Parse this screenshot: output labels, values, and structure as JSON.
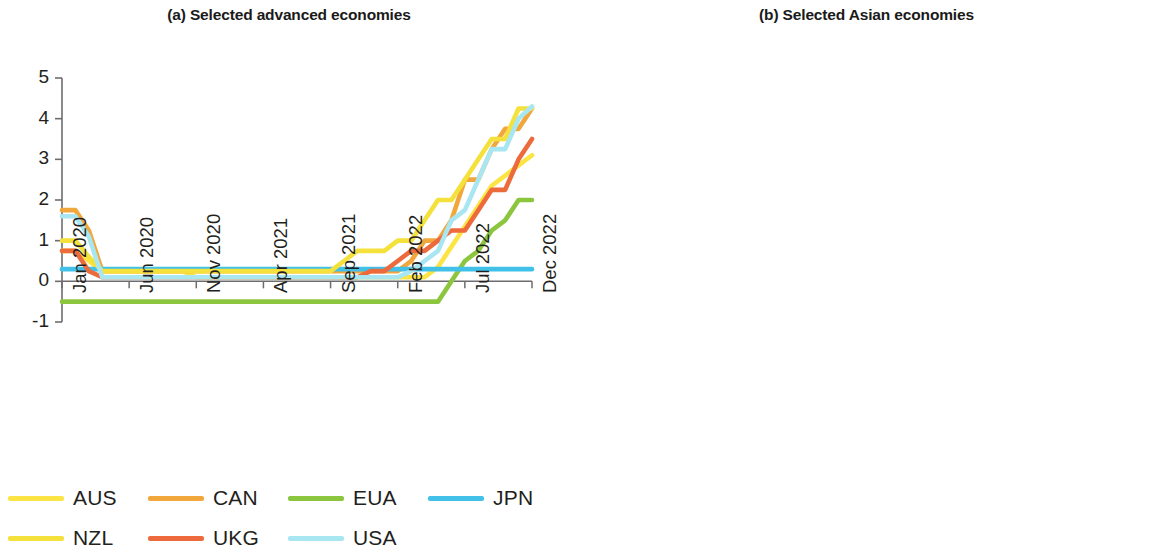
{
  "figure": {
    "background": "#ffffff",
    "axis_color": "#6d6d6d",
    "text_color": "#231f20"
  },
  "panels": [
    {
      "id": "a",
      "title": "(a) Selected advanced economies"
    },
    {
      "id": "b",
      "title": "(b) Selected Asian economies"
    }
  ],
  "chart_data": [
    {
      "type": "line",
      "title": "(a) Selected advanced economies",
      "xlabel": "",
      "ylabel": "",
      "ylim": [
        -1,
        5
      ],
      "yticks": [
        -1,
        0,
        1,
        2,
        3,
        4,
        5
      ],
      "ytick_labels": [
        "-1",
        "0",
        "1",
        "2",
        "3",
        "4",
        "5"
      ],
      "grid": false,
      "zero_line": true,
      "legend_position": "bottom",
      "x": [
        "Jan 2020",
        "Feb 2020",
        "Mar 2020",
        "Apr 2020",
        "May 2020",
        "Jun 2020",
        "Jul 2020",
        "Aug 2020",
        "Sep 2020",
        "Oct 2020",
        "Nov 2020",
        "Dec 2020",
        "Jan 2021",
        "Feb 2021",
        "Mar 2021",
        "Apr 2021",
        "May 2021",
        "Jun 2021",
        "Jul 2021",
        "Aug 2021",
        "Sep 2021",
        "Oct 2021",
        "Nov 2021",
        "Dec 2021",
        "Jan 2022",
        "Feb 2022",
        "Mar 2022",
        "Apr 2022",
        "May 2022",
        "Jun 2022",
        "Jul 2022",
        "Aug 2022",
        "Sep 2022",
        "Oct 2022",
        "Nov 2022",
        "Dec 2022"
      ],
      "xticks": [
        "Jan 2020",
        "Jun 2020",
        "Nov 2020",
        "Apr 2021",
        "Sep 2021",
        "Feb 2022",
        "Jul 2022",
        "Dec 2022"
      ],
      "xtick_indices": [
        0,
        5,
        10,
        15,
        20,
        25,
        30,
        35
      ],
      "series": [
        {
          "name": "AUS",
          "color": "#fde445",
          "values": [
            0.75,
            0.75,
            0.5,
            0.25,
            0.25,
            0.25,
            0.25,
            0.25,
            0.25,
            0.25,
            0.1,
            0.1,
            0.1,
            0.1,
            0.1,
            0.1,
            0.1,
            0.1,
            0.1,
            0.1,
            0.1,
            0.1,
            0.1,
            0.1,
            0.1,
            0.1,
            0.1,
            0.1,
            0.35,
            0.85,
            1.35,
            1.85,
            2.35,
            2.6,
            2.85,
            3.1
          ]
        },
        {
          "name": "CAN",
          "color": "#f2a73d",
          "values": [
            1.75,
            1.75,
            1.25,
            0.25,
            0.25,
            0.25,
            0.25,
            0.25,
            0.25,
            0.25,
            0.25,
            0.25,
            0.25,
            0.25,
            0.25,
            0.25,
            0.25,
            0.25,
            0.25,
            0.25,
            0.25,
            0.25,
            0.25,
            0.25,
            0.25,
            0.25,
            0.5,
            1.0,
            1.0,
            1.5,
            2.5,
            2.5,
            3.25,
            3.75,
            3.75,
            4.25
          ]
        },
        {
          "name": "EUA",
          "color": "#8cc63e",
          "values": [
            -0.5,
            -0.5,
            -0.5,
            -0.5,
            -0.5,
            -0.5,
            -0.5,
            -0.5,
            -0.5,
            -0.5,
            -0.5,
            -0.5,
            -0.5,
            -0.5,
            -0.5,
            -0.5,
            -0.5,
            -0.5,
            -0.5,
            -0.5,
            -0.5,
            -0.5,
            -0.5,
            -0.5,
            -0.5,
            -0.5,
            -0.5,
            -0.5,
            -0.5,
            0.0,
            0.5,
            0.75,
            1.25,
            1.5,
            2.0,
            2.0
          ]
        },
        {
          "name": "JPN",
          "color": "#41c0e8",
          "values": [
            0.3,
            0.3,
            0.3,
            0.3,
            0.3,
            0.3,
            0.3,
            0.3,
            0.3,
            0.3,
            0.3,
            0.3,
            0.3,
            0.3,
            0.3,
            0.3,
            0.3,
            0.3,
            0.3,
            0.3,
            0.3,
            0.3,
            0.3,
            0.3,
            0.3,
            0.3,
            0.3,
            0.3,
            0.3,
            0.3,
            0.3,
            0.3,
            0.3,
            0.3,
            0.3,
            0.3
          ]
        },
        {
          "name": "NZL",
          "color": "#f5e13c",
          "values": [
            1.0,
            1.0,
            0.6,
            0.25,
            0.25,
            0.25,
            0.25,
            0.25,
            0.25,
            0.25,
            0.25,
            0.25,
            0.25,
            0.25,
            0.25,
            0.25,
            0.25,
            0.25,
            0.25,
            0.25,
            0.25,
            0.5,
            0.75,
            0.75,
            0.75,
            1.0,
            1.0,
            1.5,
            2.0,
            2.0,
            2.5,
            3.0,
            3.5,
            3.5,
            4.25,
            4.25
          ]
        },
        {
          "name": "UKG",
          "color": "#ec6a3c",
          "values": [
            0.75,
            0.75,
            0.25,
            0.1,
            0.1,
            0.1,
            0.1,
            0.1,
            0.1,
            0.1,
            0.1,
            0.1,
            0.1,
            0.1,
            0.1,
            0.1,
            0.1,
            0.1,
            0.1,
            0.1,
            0.1,
            0.1,
            0.1,
            0.25,
            0.25,
            0.5,
            0.75,
            0.75,
            1.0,
            1.25,
            1.25,
            1.75,
            2.25,
            2.25,
            3.0,
            3.5
          ]
        },
        {
          "name": "USA",
          "color": "#a8e6f2",
          "values": [
            1.6,
            1.6,
            1.1,
            0.1,
            0.1,
            0.1,
            0.1,
            0.1,
            0.1,
            0.1,
            0.1,
            0.1,
            0.1,
            0.1,
            0.1,
            0.1,
            0.1,
            0.1,
            0.1,
            0.1,
            0.1,
            0.1,
            0.1,
            0.1,
            0.1,
            0.1,
            0.25,
            0.5,
            0.75,
            1.5,
            1.75,
            2.5,
            3.25,
            3.25,
            4.0,
            4.3
          ]
        }
      ]
    },
    {
      "type": "line",
      "title": "(b) Selected Asian economies",
      "xlabel": "",
      "ylabel": "",
      "ylim": [
        0,
        16
      ],
      "yticks": [
        0,
        4,
        8,
        12,
        16
      ],
      "ytick_labels": [
        "0",
        "4",
        "8",
        "12",
        "16"
      ],
      "grid": false,
      "zero_line": false,
      "legend_position": "bottom",
      "x": [
        "Jan 2020",
        "Feb 2020",
        "Mar 2020",
        "Apr 2020",
        "May 2020",
        "Jun 2020",
        "Jul 2020",
        "Aug 2020",
        "Sep 2020",
        "Oct 2020",
        "Nov 2020",
        "Dec 2020",
        "Jan 2021",
        "Feb 2021",
        "Mar 2021",
        "Apr 2021",
        "May 2021",
        "Jun 2021",
        "Jul 2021",
        "Aug 2021",
        "Sep 2021",
        "Oct 2021",
        "Nov 2021",
        "Dec 2021",
        "Jan 2022",
        "Feb 2022",
        "Mar 2022",
        "Apr 2022",
        "May 2022",
        "Jun 2022",
        "Jul 2022",
        "Aug 2022",
        "Sep 2022",
        "Oct 2022",
        "Nov 2022",
        "Dec 2022"
      ],
      "xticks": [
        "Jan 2020",
        "Jun 2020",
        "Nov 2020",
        "Apr 2021",
        "Sep 2021",
        "Feb 2022",
        "Jul 2022",
        "Dec 2022"
      ],
      "xtick_indices": [
        0,
        5,
        10,
        15,
        20,
        25,
        30,
        35
      ],
      "series": [
        {
          "name": "ARM",
          "color": "#f2a73d",
          "values": [
            5.5,
            5.5,
            5.25,
            5.0,
            5.0,
            4.5,
            4.5,
            4.5,
            4.5,
            4.5,
            4.5,
            4.5,
            4.5,
            4.5,
            4.5,
            4.5,
            4.75,
            5.0,
            5.5,
            5.5,
            6.0,
            6.5,
            6.5,
            7.0,
            7.25,
            7.75,
            8.0,
            8.0,
            8.25,
            8.5,
            8.75,
            9.0,
            9.5,
            9.75,
            10.25,
            10.7
          ]
        },
        {
          "name": "HKG",
          "color": "#f5a08a",
          "values": [
            2.0,
            1.8,
            1.5,
            1.0,
            0.6,
            0.5,
            0.5,
            0.5,
            0.5,
            0.5,
            0.5,
            0.5,
            0.5,
            0.5,
            0.5,
            0.5,
            0.5,
            0.5,
            0.5,
            0.5,
            0.5,
            0.5,
            0.5,
            0.5,
            0.5,
            0.6,
            0.8,
            1.3,
            1.8,
            2.2,
            2.6,
            3.0,
            3.4,
            3.8,
            4.2,
            4.5
          ]
        },
        {
          "name": "IND",
          "color": "#8ad9f0",
          "values": [
            5.15,
            5.15,
            4.4,
            4.4,
            4.4,
            4.0,
            4.0,
            4.0,
            4.0,
            4.0,
            4.0,
            4.0,
            4.0,
            4.0,
            4.0,
            4.0,
            4.0,
            4.0,
            4.0,
            4.0,
            4.0,
            4.0,
            4.0,
            4.0,
            4.0,
            4.0,
            4.0,
            4.4,
            4.9,
            4.9,
            5.4,
            5.4,
            5.9,
            5.9,
            6.25,
            6.25
          ]
        },
        {
          "name": "KAZ",
          "color": "#8cc63e",
          "values": [
            9.25,
            9.25,
            9.5,
            12.0,
            9.5,
            9.5,
            9.5,
            9.5,
            9.0,
            9.0,
            9.0,
            9.0,
            9.0,
            9.0,
            9.0,
            9.0,
            9.0,
            9.25,
            9.25,
            9.25,
            9.5,
            9.75,
            9.75,
            9.75,
            10.25,
            13.5,
            14.0,
            14.0,
            14.0,
            14.0,
            14.5,
            14.5,
            14.5,
            16.0,
            16.0,
            16.0
          ]
        },
        {
          "name": "KOR",
          "color": "#f8f39a",
          "values": [
            1.25,
            1.25,
            0.75,
            0.75,
            0.5,
            0.5,
            0.5,
            0.5,
            0.5,
            0.5,
            0.5,
            0.5,
            0.5,
            0.5,
            0.5,
            0.5,
            0.5,
            0.5,
            0.5,
            0.75,
            0.75,
            0.75,
            1.0,
            1.0,
            1.0,
            1.25,
            1.25,
            1.5,
            1.75,
            1.75,
            2.25,
            2.5,
            2.5,
            3.0,
            3.25,
            3.25
          ]
        },
        {
          "name": "KGZ",
          "color": "#fce82c",
          "values": [
            4.25,
            4.25,
            4.0,
            3.0,
            2.5,
            2.0,
            2.0,
            1.75,
            1.75,
            1.75,
            1.75,
            1.75,
            1.75,
            1.75,
            1.75,
            1.75,
            2.0,
            4.25,
            4.5,
            4.5,
            5.0,
            5.75,
            5.5,
            5.5,
            6.0,
            6.0,
            12.5,
            14.0,
            14.0,
            14.0,
            14.0,
            14.0,
            14.0,
            14.0,
            13.0,
            13.0
          ]
        },
        {
          "name": "MAL",
          "color": "#42b8dd",
          "values": [
            2.75,
            2.75,
            2.5,
            2.25,
            1.75,
            1.75,
            1.75,
            1.75,
            1.75,
            1.75,
            1.75,
            1.75,
            1.75,
            1.75,
            1.75,
            1.75,
            1.75,
            1.75,
            1.75,
            1.75,
            1.75,
            1.75,
            1.75,
            1.75,
            1.75,
            1.75,
            1.75,
            1.75,
            2.0,
            2.0,
            2.25,
            2.5,
            2.5,
            2.75,
            2.75,
            2.75
          ]
        },
        {
          "name": "NEP",
          "color": "#f2834a",
          "values": [
            6.0,
            6.0,
            5.5,
            5.0,
            5.0,
            5.0,
            5.0,
            5.0,
            5.0,
            5.0,
            5.0,
            5.0,
            5.0,
            5.0,
            5.0,
            5.0,
            5.0,
            5.0,
            5.0,
            5.0,
            5.0,
            5.0,
            5.0,
            5.0,
            5.0,
            5.5,
            7.0,
            7.0,
            7.0,
            7.0,
            7.0,
            8.5,
            8.5,
            8.5,
            8.5,
            8.5
          ]
        },
        {
          "name": "PHI",
          "color": "#e8ea4a",
          "values": [
            4.0,
            4.0,
            3.25,
            2.75,
            2.75,
            2.25,
            2.25,
            2.25,
            2.0,
            2.0,
            2.0,
            2.0,
            2.0,
            2.0,
            2.0,
            2.0,
            2.0,
            2.0,
            2.0,
            2.0,
            2.0,
            2.0,
            2.0,
            2.0,
            2.0,
            2.0,
            2.0,
            2.4,
            2.75,
            3.25,
            3.5,
            4.0,
            4.25,
            4.75,
            5.5,
            5.5
          ]
        },
        {
          "name": "PRC",
          "color": "#f2733f",
          "values": [
            4.0,
            4.0,
            4.0,
            4.0,
            4.0,
            4.0,
            4.0,
            4.0,
            3.85,
            3.85,
            3.85,
            3.85,
            3.85,
            3.85,
            3.85,
            3.85,
            3.85,
            3.85,
            3.85,
            3.85,
            3.85,
            3.85,
            3.85,
            3.85,
            3.7,
            3.7,
            3.7,
            3.7,
            3.7,
            3.7,
            3.7,
            3.65,
            3.65,
            3.65,
            3.65,
            3.65
          ]
        },
        {
          "name": "SRI",
          "color": "#a8d4f0",
          "values": [
            6.5,
            6.5,
            6.25,
            6.0,
            6.0,
            5.5,
            5.25,
            5.0,
            4.75,
            4.5,
            4.5,
            4.5,
            4.5,
            4.5,
            4.5,
            4.5,
            4.5,
            4.5,
            4.5,
            4.5,
            4.5,
            4.5,
            4.5,
            4.5,
            5.5,
            6.5,
            7.5,
            11.5,
            14.5,
            14.5,
            14.5,
            14.5,
            14.5,
            14.5,
            14.5,
            14.5
          ]
        },
        {
          "name": "TAP",
          "color": "#41c0e8",
          "values": [
            1.15,
            1.15,
            1.15,
            1.1,
            1.1,
            1.1,
            1.1,
            1.1,
            1.1,
            1.1,
            1.1,
            1.1,
            1.1,
            1.1,
            1.1,
            1.1,
            1.1,
            1.1,
            1.1,
            1.1,
            1.1,
            1.1,
            1.1,
            1.1,
            1.15,
            1.2,
            1.3,
            1.4,
            1.45,
            1.5,
            1.55,
            1.6,
            1.65,
            1.7,
            1.75,
            1.75
          ]
        }
      ]
    }
  ],
  "legends": {
    "panel_a": [
      {
        "label": "AUS",
        "color": "#fde445"
      },
      {
        "label": "CAN",
        "color": "#f2a73d"
      },
      {
        "label": "EUA",
        "color": "#8cc63e"
      },
      {
        "label": "JPN",
        "color": "#41c0e8"
      },
      {
        "label": "NZL",
        "color": "#f5e13c"
      },
      {
        "label": "UKG",
        "color": "#ec6a3c"
      },
      {
        "label": "USA",
        "color": "#a8e6f2"
      }
    ],
    "panel_b": [
      {
        "label": "ARM",
        "color": "#f2a73d"
      },
      {
        "label": "HKG",
        "color": "#f5a08a"
      },
      {
        "label": "IND",
        "color": "#8ad9f0"
      },
      {
        "label": "KAZ",
        "color": "#8cc63e"
      },
      {
        "label": "KOR",
        "color": "#f8f39a"
      },
      {
        "label": "KGZ",
        "color": "#fce82c"
      },
      {
        "label": "MAL",
        "color": "#42b8dd"
      },
      {
        "label": "NEP",
        "color": "#f2834a"
      },
      {
        "label": "PHI",
        "color": "#e8ea4a"
      },
      {
        "label": "PRC",
        "color": "#f2733f"
      },
      {
        "label": "SRI",
        "color": "#a8d4f0"
      },
      {
        "label": "TAP",
        "color": "#41c0e8"
      }
    ]
  }
}
